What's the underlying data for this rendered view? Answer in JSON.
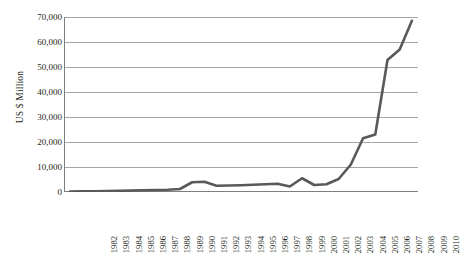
{
  "chart_data": {
    "type": "line",
    "title": "",
    "subtitle": "",
    "xlabel": "",
    "ylabel": "US $ Million",
    "ylim": [
      0,
      70000
    ],
    "xlim": [
      "1982",
      "2010"
    ],
    "grid": "horizontal",
    "legend": "none",
    "y_ticks": [
      "0",
      "10,000",
      "20,000",
      "30,000",
      "40,000",
      "50,000",
      "60,000",
      "70,000"
    ],
    "y_tick_values": [
      0,
      10000,
      20000,
      30000,
      40000,
      50000,
      60000,
      70000
    ],
    "categories": [
      "1982",
      "1983",
      "1984",
      "1985",
      "1986",
      "1987",
      "1988",
      "1989",
      "1990",
      "1991",
      "1992",
      "1993",
      "1994",
      "1995",
      "1996",
      "1997",
      "1998",
      "1999",
      "2000",
      "2001",
      "2002",
      "2003",
      "2004",
      "2005",
      "2006",
      "2007",
      "2008",
      "2009",
      "2010"
    ],
    "values": [
      200,
      250,
      300,
      400,
      500,
      600,
      700,
      800,
      900,
      1200,
      3900,
      4100,
      2500,
      2600,
      2700,
      2900,
      3100,
      3300,
      2200,
      5500,
      2800,
      3100,
      5200,
      11000,
      21500,
      23000,
      52800,
      57000,
      68500
    ],
    "series": [
      {
        "name": "US $ Million",
        "color": "#595959",
        "values": [
          200,
          250,
          300,
          400,
          500,
          600,
          700,
          800,
          900,
          1200,
          3900,
          4100,
          2500,
          2600,
          2700,
          2900,
          3100,
          3300,
          2200,
          5500,
          2800,
          3100,
          5200,
          11000,
          21500,
          23000,
          52800,
          57000,
          68500
        ]
      }
    ],
    "colors": {
      "line": "#595959",
      "grid": "#a6a6a6",
      "axis": "#7f7f7f",
      "text": "#231f20",
      "background": "#ffffff"
    }
  }
}
